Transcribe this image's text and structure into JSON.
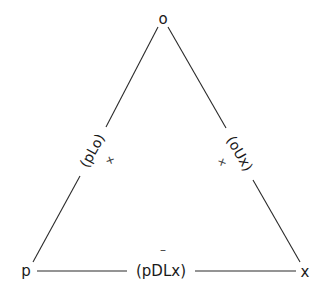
{
  "diagram": {
    "type": "triangle-balance-diagram",
    "vertices": {
      "top": {
        "label": "o"
      },
      "left": {
        "label": "p"
      },
      "right": {
        "label": "x"
      }
    },
    "edges": {
      "left": {
        "label": "(pLo)",
        "sign": "+"
      },
      "right": {
        "label": "(oUx)",
        "sign": "+"
      },
      "bottom": {
        "label": "(pDLx)",
        "sign": "–"
      }
    }
  }
}
